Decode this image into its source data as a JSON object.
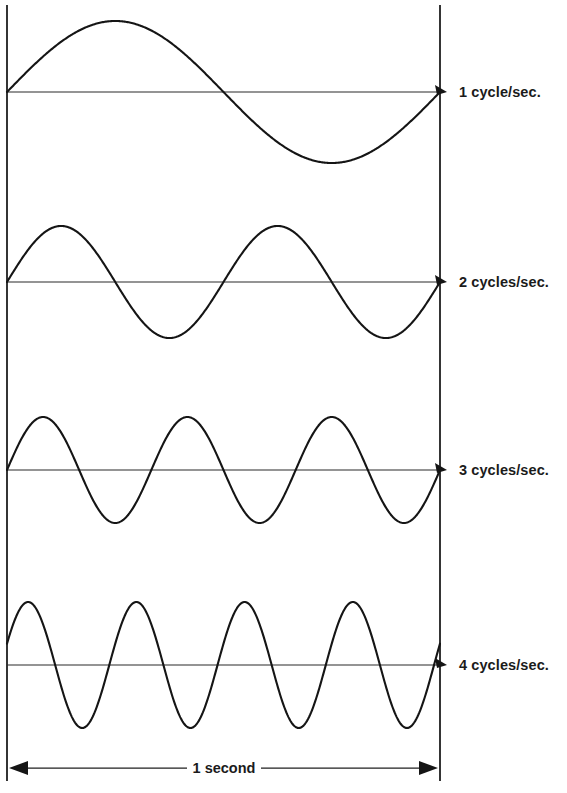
{
  "figure": {
    "background_color": "#ffffff",
    "ink_color": "#151515",
    "width": 567,
    "height": 793
  },
  "axis": {
    "left_line_x": 7,
    "right_line_x": 440,
    "top_y": 5,
    "bottom_y": 781
  },
  "waves": [
    {
      "id": "wave-1",
      "label": "1 cycle/sec.",
      "cycles": 1,
      "baseline_y": 92,
      "amplitude": 71,
      "phase_start_fraction": 0.0,
      "label_x": 459,
      "label_y": 85
    },
    {
      "id": "wave-2",
      "label": "2 cycles/sec.",
      "cycles": 2,
      "baseline_y": 282,
      "amplitude": 56,
      "phase_start_fraction": 0.0,
      "label_x": 459,
      "label_y": 275
    },
    {
      "id": "wave-3",
      "label": "3 cycles/sec.",
      "cycles": 3,
      "baseline_y": 470,
      "amplitude": 53,
      "phase_start_fraction": 0.0,
      "label_x": 459,
      "label_y": 463
    },
    {
      "id": "wave-4",
      "label": "4 cycles/sec.",
      "cycles": 4,
      "baseline_y": 665,
      "amplitude": 63,
      "phase_start_fraction": 0.055,
      "label_x": 459,
      "label_y": 658
    }
  ],
  "dimension": {
    "label": "1 second",
    "y": 768,
    "start_x": 9,
    "end_x": 438,
    "label_center_x": 224,
    "label_y": 761
  },
  "chart_data": {
    "type": "line",
    "title": "",
    "subtitle": "",
    "xlabel": "1 second",
    "ylabel": "",
    "grid": false,
    "legend_position": "right",
    "x_range_seconds": [
      0,
      1
    ],
    "axis_annotation": "Vertical rules mark the start and end of a one-second interval; horizontal rules are the zero baselines of each waveform.",
    "series": [
      {
        "name": "1 cycle/sec.",
        "frequency_hz": 1,
        "waveform": "sine",
        "cycles_in_1_second": 1,
        "relative_amplitude": 1.0,
        "peaks_x_fraction": [
          0.25
        ],
        "troughs_x_fraction": [
          0.75
        ],
        "zero_crossings_x_fraction": [
          0.0,
          0.5,
          1.0
        ]
      },
      {
        "name": "2 cycles/sec.",
        "frequency_hz": 2,
        "waveform": "sine",
        "cycles_in_1_second": 2,
        "relative_amplitude": 0.79,
        "peaks_x_fraction": [
          0.125,
          0.625
        ],
        "troughs_x_fraction": [
          0.375,
          0.875
        ],
        "zero_crossings_x_fraction": [
          0.0,
          0.25,
          0.5,
          0.75,
          1.0
        ]
      },
      {
        "name": "3 cycles/sec.",
        "frequency_hz": 3,
        "waveform": "sine",
        "cycles_in_1_second": 3,
        "relative_amplitude": 0.75,
        "peaks_x_fraction": [
          0.0833,
          0.4167,
          0.75
        ],
        "troughs_x_fraction": [
          0.25,
          0.5833,
          0.9167
        ],
        "zero_crossings_x_fraction": [
          0.0,
          0.1667,
          0.3333,
          0.5,
          0.6667,
          0.8333,
          1.0
        ]
      },
      {
        "name": "4 cycles/sec.",
        "frequency_hz": 4,
        "waveform": "sine",
        "cycles_in_1_second": 4,
        "relative_amplitude": 0.89,
        "peaks_x_fraction": [
          0.0375,
          0.2875,
          0.5375,
          0.7875
        ],
        "troughs_x_fraction": [
          0.1625,
          0.4125,
          0.6625,
          0.9125
        ],
        "zero_crossings_x_fraction": [
          0.1,
          0.225,
          0.35,
          0.475,
          0.6,
          0.725,
          0.85,
          0.975
        ]
      }
    ]
  }
}
